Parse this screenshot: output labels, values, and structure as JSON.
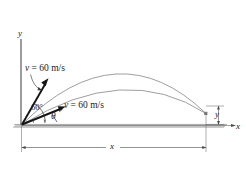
{
  "figure": {
    "type": "projectile-motion-diagram",
    "axes": {
      "y_label": "y",
      "x_label": "x"
    },
    "velocity_upper": {
      "label": "v = 60 m/s",
      "angle_label": "60°"
    },
    "velocity_lower": {
      "label": "v = 60 m/s",
      "angle_label": "θ"
    },
    "dimensions": {
      "horizontal_label": "x",
      "vertical_label": "y"
    },
    "colors": {
      "ink": "#1a1a1a",
      "curve": "#8a8a8a",
      "ground": "#b9b9b9",
      "leader": "#555555"
    }
  }
}
